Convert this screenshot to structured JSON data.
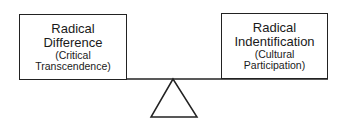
{
  "diagram": {
    "left": {
      "title_line1": "Radical",
      "title_line2": "Difference",
      "sub_line1": "(Critical",
      "sub_line2": "Transcendence)"
    },
    "right": {
      "title_line1": "Radical",
      "title_line2": "Indentification",
      "sub_line1": "(Cultural",
      "sub_line2": "Participation)"
    }
  }
}
